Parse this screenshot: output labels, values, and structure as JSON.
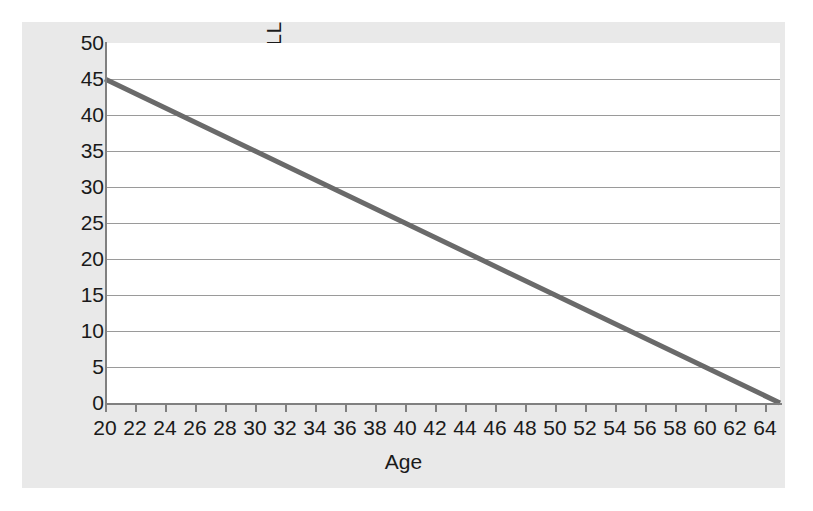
{
  "chart_data": {
    "type": "line",
    "title": "",
    "xlabel": "Age",
    "ylabel": "YPLL",
    "xlim": [
      20,
      65
    ],
    "ylim": [
      0,
      50
    ],
    "grid": true,
    "legend": "none",
    "series": [
      {
        "name": "YPLL",
        "color": "#6a6a6a",
        "x": [
          20,
          65
        ],
        "values": [
          45,
          0
        ]
      }
    ],
    "x_ticks": [
      20,
      22,
      24,
      26,
      28,
      30,
      32,
      34,
      36,
      38,
      40,
      42,
      44,
      46,
      48,
      50,
      52,
      54,
      56,
      58,
      60,
      62,
      64
    ],
    "x_tick_labels": [
      "20",
      "22",
      "24",
      "26",
      "28",
      "30",
      "32",
      "34",
      "36",
      "38",
      "40",
      "42",
      "44",
      "46",
      "48",
      "50",
      "52",
      "54",
      "56",
      "58",
      "60",
      "62",
      "64"
    ],
    "y_ticks": [
      0,
      5,
      10,
      15,
      20,
      25,
      30,
      35,
      40,
      45,
      50
    ],
    "y_tick_labels": [
      "0",
      "5",
      "10",
      "15",
      "20",
      "25",
      "30",
      "35",
      "40",
      "45",
      "50"
    ],
    "points": [
      {
        "x": 20,
        "y": 45
      },
      {
        "x": 25,
        "y": 40
      },
      {
        "x": 30,
        "y": 35
      },
      {
        "x": 35,
        "y": 30
      },
      {
        "x": 40,
        "y": 25
      },
      {
        "x": 45,
        "y": 20
      },
      {
        "x": 50,
        "y": 15
      },
      {
        "x": 55,
        "y": 10
      },
      {
        "x": 60,
        "y": 5
      },
      {
        "x": 65,
        "y": 0
      }
    ]
  },
  "colors": {
    "figure_background": "#e9e9e9",
    "plot_background": "#ffffff",
    "gridline": "#9a9a9a",
    "axis": "#808080",
    "series_line": "#6a6a6a",
    "text": "#1a1a1a"
  }
}
